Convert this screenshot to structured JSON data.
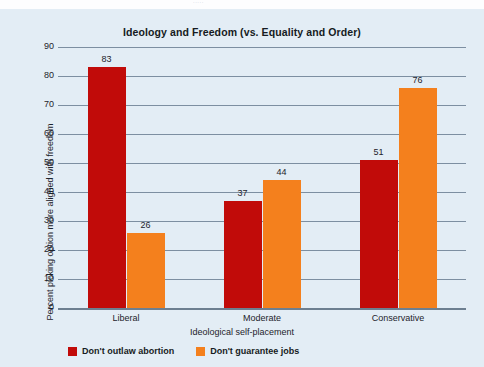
{
  "figure": {
    "background_color": "#e3edf5",
    "top_strip_artifact": "·····"
  },
  "chart_data": {
    "type": "bar",
    "title": "Ideology and Freedom (vs. Equality and Order)",
    "xlabel": "Ideological self-placement",
    "ylabel": "Percent picking option more aligned with freedom",
    "categories": [
      "Liberal",
      "Moderate",
      "Conservative"
    ],
    "series": [
      {
        "name": "Don't outlaw abortion",
        "color": "#c10b09",
        "values": [
          83,
          37,
          51
        ]
      },
      {
        "name": "Don't guarantee jobs",
        "color": "#f4801d",
        "values": [
          26,
          44,
          76
        ]
      }
    ],
    "ylim": [
      0,
      90
    ],
    "yticks": [
      0,
      10,
      20,
      30,
      40,
      50,
      60,
      70,
      80,
      90
    ],
    "ytick_labels": [
      "0",
      "10",
      "20",
      "30",
      "40",
      "50",
      "60",
      "70",
      "80",
      "90"
    ],
    "grid": true,
    "grid_axis": "y",
    "legend_position": "bottom-left",
    "data_labels": [
      "83",
      "26",
      "37",
      "44",
      "51",
      "76"
    ]
  }
}
